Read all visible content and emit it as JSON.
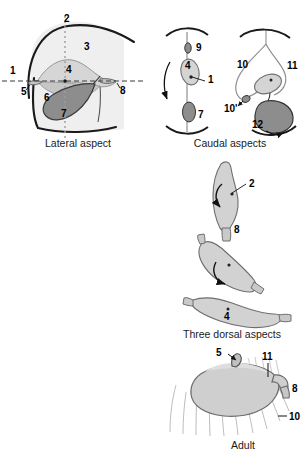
{
  "figure": {
    "background_color": "#ffffff",
    "line_color": "#1a1a1a",
    "panels": [
      {
        "id": "lateral-aspect",
        "caption": "Lateral aspect",
        "caption_x": 78,
        "caption_y": 147,
        "labels": [
          {
            "key": "2",
            "text": "2",
            "x": 64,
            "y": 22
          },
          {
            "key": "3",
            "text": "3",
            "x": 84,
            "y": 50
          },
          {
            "key": "1",
            "text": "1",
            "x": 10,
            "y": 74
          },
          {
            "key": "4",
            "text": "4",
            "x": 66,
            "y": 73
          },
          {
            "key": "5",
            "text": "5",
            "x": 21,
            "y": 95
          },
          {
            "key": "8",
            "text": "8",
            "x": 120,
            "y": 94
          },
          {
            "key": "6",
            "text": "6",
            "x": 44,
            "y": 101
          },
          {
            "key": "7",
            "text": "7",
            "x": 61,
            "y": 117
          }
        ]
      },
      {
        "id": "caudal-aspects",
        "caption": "Caudal aspects",
        "caption_x": 230,
        "caption_y": 147,
        "labels": [
          {
            "key": "9",
            "text": "9",
            "x": 196,
            "y": 51
          },
          {
            "key": "4",
            "text": "4",
            "x": 185,
            "y": 69
          },
          {
            "key": "1",
            "text": "1",
            "x": 208,
            "y": 83
          },
          {
            "key": "7",
            "text": "7",
            "x": 198,
            "y": 118
          },
          {
            "key": "10",
            "text": "10",
            "x": 237,
            "y": 68
          },
          {
            "key": "11",
            "text": "11",
            "x": 287,
            "y": 69
          },
          {
            "key": "10p",
            "text": "10'",
            "x": 232,
            "y": 105
          },
          {
            "key": "12",
            "text": "12",
            "x": 258,
            "y": 125
          }
        ]
      },
      {
        "id": "three-dorsal-aspects",
        "caption": "Three dorsal aspects",
        "caption_x": 232,
        "caption_y": 338,
        "labels": [
          {
            "key": "2",
            "text": "2",
            "x": 249,
            "y": 187
          },
          {
            "key": "8",
            "text": "8",
            "x": 234,
            "y": 233
          },
          {
            "key": "4",
            "text": "4",
            "x": 230,
            "y": 318
          }
        ]
      },
      {
        "id": "adult",
        "caption": "Adult",
        "caption_x": 243,
        "caption_y": 449,
        "labels": [
          {
            "key": "5",
            "text": "5",
            "x": 221,
            "y": 356
          },
          {
            "key": "11",
            "text": "11",
            "x": 265,
            "y": 360
          },
          {
            "key": "8",
            "text": "8",
            "x": 291,
            "y": 389
          },
          {
            "key": "10",
            "text": "10",
            "x": 290,
            "y": 419
          }
        ]
      }
    ],
    "colors": {
      "outline": "#1a1a1a",
      "pale_fill": "#ececec",
      "light_gray_fill": "#d2d2d2",
      "mid_gray_fill": "#b9b9b9",
      "dark_gray_fill": "#8a8a8a",
      "axis_dash": "#444444",
      "axis_dot": "#9a9a9a"
    }
  }
}
